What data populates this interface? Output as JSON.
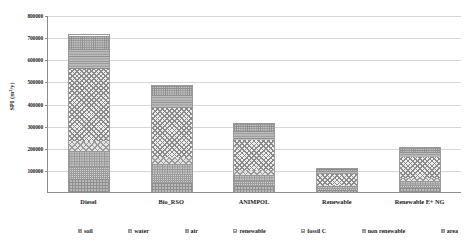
{
  "chart_data": {
    "type": "bar",
    "title": "",
    "subtitle": "",
    "xlabel": "",
    "ylabel": "SPI (m²/y)",
    "ylim": [
      0,
      800000
    ],
    "ytick_interval": 100000,
    "grid": true,
    "legend_position": "bottom",
    "stacked": true,
    "ticks": [
      {
        "label": "800000",
        "value": 800000
      },
      {
        "label": "700000",
        "value": 700000
      },
      {
        "label": "600000",
        "value": 600000
      },
      {
        "label": "500000",
        "value": 500000
      },
      {
        "label": "400000",
        "value": 400000
      },
      {
        "label": "300000",
        "value": 300000
      },
      {
        "label": "200000",
        "value": 200000
      },
      {
        "label": "100000",
        "value": 100000
      }
    ],
    "categories": [
      "Diesel",
      "Bio_RSO",
      "ANIMPOL",
      "Renewable",
      "Renewable E+ NG"
    ],
    "totals": [
      712000,
      485000,
      310000,
      110000,
      205000
    ],
    "series": [
      {
        "name": "soil",
        "pattern": "pat-soil",
        "values": [
          60000,
          42000,
          26000,
          9000,
          17000
        ]
      },
      {
        "name": "water",
        "pattern": "pat-water",
        "values": [
          55000,
          38000,
          24000,
          8000,
          16000
        ]
      },
      {
        "name": "air",
        "pattern": "pat-air",
        "values": [
          70000,
          48000,
          30000,
          11000,
          20000
        ]
      },
      {
        "name": "renewable",
        "pattern": "pat-renewable",
        "values": [
          45000,
          30000,
          20000,
          7000,
          13000
        ]
      },
      {
        "name": "fossil C",
        "pattern": "pat-fossilc",
        "values": [
          330000,
          225000,
          140000,
          48000,
          95000
        ]
      },
      {
        "name": "non renewable",
        "pattern": "pat-nonrenew",
        "values": [
          92000,
          62000,
          40000,
          14000,
          26000
        ]
      },
      {
        "name": "area",
        "pattern": "pat-area",
        "values": [
          60000,
          40000,
          30000,
          13000,
          18000
        ]
      }
    ]
  },
  "legend": {
    "items": [
      {
        "label": "soil"
      },
      {
        "label": "water"
      },
      {
        "label": "air"
      },
      {
        "label": "renewable"
      },
      {
        "label": "fossil C"
      },
      {
        "label": "non renewable"
      },
      {
        "label": "area"
      }
    ]
  },
  "colors": {
    "axis": "#8d8d8d",
    "grid": "#d7d7d7",
    "text": "#1a1a1a",
    "background": "#ffffff",
    "bar_outline": "#9a9a9a"
  }
}
